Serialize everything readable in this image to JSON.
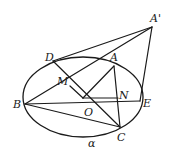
{
  "figure": {
    "type": "geometry-diagram",
    "plane_label": "α",
    "ellipse": {
      "cx": 83,
      "cy": 97,
      "rx": 60,
      "ry": 40
    },
    "points": [
      {
        "name": "A'",
        "x": 152,
        "y": 27,
        "lx": 150,
        "ly": 22
      },
      {
        "name": "A",
        "x": 114,
        "y": 66,
        "lx": 110,
        "ly": 61
      },
      {
        "name": "D",
        "x": 53,
        "y": 61,
        "lx": 45,
        "ly": 61
      },
      {
        "name": "M",
        "x": 70,
        "y": 86,
        "lx": 57,
        "ly": 85
      },
      {
        "name": "O",
        "x": 83,
        "y": 98,
        "lx": 84,
        "ly": 116
      },
      {
        "name": "N",
        "x": 118,
        "y": 98,
        "lx": 119,
        "ly": 99
      },
      {
        "name": "B",
        "x": 25,
        "y": 104,
        "lx": 13,
        "ly": 108
      },
      {
        "name": "E",
        "x": 140,
        "y": 101,
        "lx": 143,
        "ly": 107
      },
      {
        "name": "C",
        "x": 120,
        "y": 127,
        "lx": 117,
        "ly": 141
      }
    ],
    "segments": [
      [
        "D",
        "A'"
      ],
      [
        "B",
        "A'"
      ],
      [
        "A'",
        "E"
      ],
      [
        "B",
        "E"
      ],
      [
        "B",
        "C"
      ],
      [
        "D",
        "C"
      ],
      [
        "A",
        "C"
      ],
      [
        "A",
        "O"
      ],
      [
        "O",
        "N"
      ],
      [
        "M",
        "O"
      ]
    ],
    "plane_label_pos": {
      "x": 88,
      "y": 147
    }
  }
}
